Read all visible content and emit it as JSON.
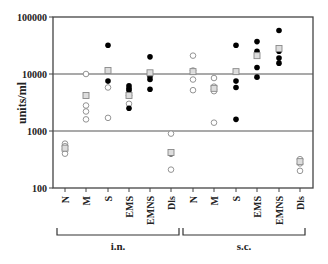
{
  "chart_data": {
    "type": "scatter",
    "title": "",
    "xlabel": "",
    "ylabel": "units/ml",
    "yscale": "log",
    "ylim": [
      100,
      100000
    ],
    "yticks": [
      100,
      1000,
      10000,
      100000
    ],
    "ytick_labels": [
      "100",
      "1000",
      "10000",
      "100000"
    ],
    "gridlines_at": [
      1000,
      10000
    ],
    "categories": [
      "N",
      "M",
      "S",
      "EMS",
      "EMNS",
      "Dls",
      "N",
      "M",
      "S",
      "EMS",
      "EMNS",
      "Dls"
    ],
    "groups": [
      {
        "label": "i.n.",
        "categories": [
          "N",
          "M",
          "S",
          "EMS",
          "EMNS",
          "Dls"
        ]
      },
      {
        "label": "s.c.",
        "categories": [
          "N",
          "M",
          "S",
          "EMS",
          "EMNS",
          "Dls"
        ]
      }
    ],
    "marker_legend": {
      "open_circle": "non-responder / individual (open)",
      "filled_circle": "individual (filled)",
      "gray_square": "group mean"
    },
    "series": [
      {
        "group": "i.n.",
        "category": "N",
        "open": [
          600,
          540,
          480,
          400
        ],
        "filled": [],
        "mean": 500
      },
      {
        "group": "i.n.",
        "category": "M",
        "open": [
          10000,
          2800,
          2200,
          1600
        ],
        "filled": [],
        "mean": 4200
      },
      {
        "group": "i.n.",
        "category": "S",
        "open": [
          5800,
          1700
        ],
        "filled": [
          32000,
          7500
        ],
        "mean": 11500
      },
      {
        "group": "i.n.",
        "category": "EMS",
        "open": [
          4200,
          3000
        ],
        "filled": [
          6200,
          5600,
          5200,
          2500
        ],
        "mean": 4200
      },
      {
        "group": "i.n.",
        "category": "EMNS",
        "open": [],
        "filled": [
          20000,
          9000,
          8000,
          5400
        ],
        "mean": 10500
      },
      {
        "group": "i.n.",
        "category": "Dls",
        "open": [
          900,
          210
        ],
        "filled": [
          400
        ],
        "mean": 420
      },
      {
        "group": "s.c.",
        "category": "N",
        "open": [
          21000,
          11500,
          8000,
          5200
        ],
        "filled": [],
        "mean": 11000
      },
      {
        "group": "s.c.",
        "category": "M",
        "open": [
          8500,
          6000,
          5400,
          5000,
          1400
        ],
        "filled": [],
        "mean": 5600
      },
      {
        "group": "s.c.",
        "category": "S",
        "open": [],
        "filled": [
          32000,
          7500,
          5800,
          1600
        ],
        "mean": 11000
      },
      {
        "group": "s.c.",
        "category": "EMS",
        "open": [],
        "filled": [
          37000,
          25000,
          13000,
          8800
        ],
        "mean": 21000
      },
      {
        "group": "s.c.",
        "category": "EMNS",
        "open": [],
        "filled": [
          58000,
          25000,
          19000,
          15500
        ],
        "mean": 28000
      },
      {
        "group": "s.c.",
        "category": "Dls",
        "open": [
          320,
          270,
          200
        ],
        "filled": [],
        "mean": 290
      }
    ]
  },
  "axis": {
    "ylabel": "units/ml",
    "yticks": [
      {
        "label": "100000",
        "value": 100000
      },
      {
        "label": "10000",
        "value": 10000
      },
      {
        "label": "1000",
        "value": 1000
      },
      {
        "label": "100",
        "value": 100
      }
    ]
  },
  "groups": [
    {
      "label": "i.n."
    },
    {
      "label": "s.c."
    }
  ],
  "categories": [
    {
      "label": "N"
    },
    {
      "label": "M"
    },
    {
      "label": "S"
    },
    {
      "label": "EMS"
    },
    {
      "label": "EMNS"
    },
    {
      "label": "Dls"
    },
    {
      "label": "N"
    },
    {
      "label": "M"
    },
    {
      "label": "S"
    },
    {
      "label": "EMS"
    },
    {
      "label": "EMNS"
    },
    {
      "label": "Dls"
    }
  ]
}
